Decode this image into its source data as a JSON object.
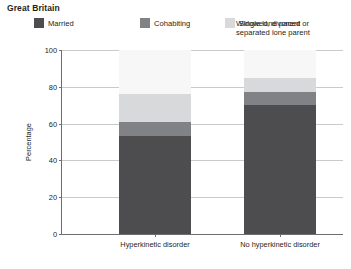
{
  "region_title": "Great Britain",
  "legend": {
    "items": [
      {
        "label": "Married",
        "color": "#4d4d4f",
        "swatch": true
      },
      {
        "label": "Cohabiting",
        "color": "#808285",
        "swatch": true
      },
      {
        "label": "Single lone parent",
        "color": "#d8d9da",
        "swatch": true
      },
      {
        "label": "Widowed, divorced or separated lone parent",
        "color": "#f7f7f7",
        "swatch": false
      }
    ]
  },
  "chart_data": {
    "type": "bar",
    "stacked": true,
    "title": "Great Britain",
    "xlabel": "",
    "ylabel": "Percentage",
    "ylim": [
      0,
      100
    ],
    "yticks": [
      0,
      20,
      40,
      60,
      80,
      100
    ],
    "grid": true,
    "legend_position": "top",
    "categories": [
      "Hyperkinetic disorder",
      "No hyperkinetic disorder"
    ],
    "series": [
      {
        "name": "Married",
        "color": "#4d4d4f",
        "values": [
          53,
          70
        ]
      },
      {
        "name": "Cohabiting",
        "color": "#808285",
        "values": [
          8,
          7
        ]
      },
      {
        "name": "Single lone parent",
        "color": "#d8d9da",
        "values": [
          15,
          8
        ]
      },
      {
        "name": "Widowed, divorced or separated lone parent",
        "color": "#f7f7f7",
        "values": [
          24,
          15
        ]
      }
    ]
  }
}
